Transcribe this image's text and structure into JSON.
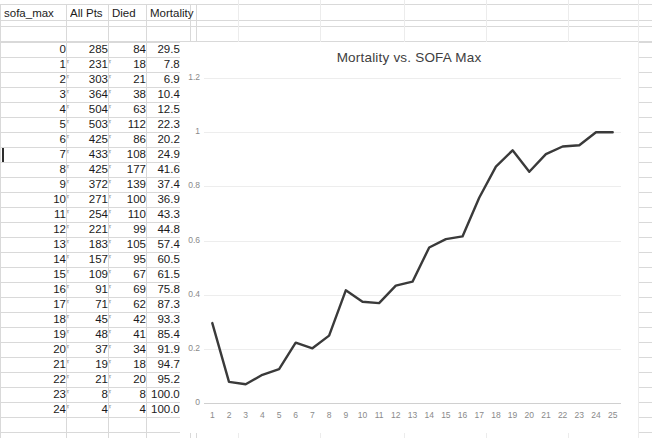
{
  "spreadsheet": {
    "columns": [
      "sofa_max",
      "All Pts",
      "Died",
      "Mortality"
    ],
    "rows": [
      {
        "sofa_max": "0",
        "all_pts": "285",
        "died": "84",
        "mortality": "29.5%"
      },
      {
        "sofa_max": "1",
        "all_pts": "231",
        "died": "18",
        "mortality": "7.8%"
      },
      {
        "sofa_max": "2",
        "all_pts": "303",
        "died": "21",
        "mortality": "6.9%"
      },
      {
        "sofa_max": "3",
        "all_pts": "364",
        "died": "38",
        "mortality": "10.4%"
      },
      {
        "sofa_max": "4",
        "all_pts": "504",
        "died": "63",
        "mortality": "12.5%"
      },
      {
        "sofa_max": "5",
        "all_pts": "503",
        "died": "112",
        "mortality": "22.3%"
      },
      {
        "sofa_max": "6",
        "all_pts": "425",
        "died": "86",
        "mortality": "20.2%"
      },
      {
        "sofa_max": "7",
        "all_pts": "433",
        "died": "108",
        "mortality": "24.9%"
      },
      {
        "sofa_max": "8",
        "all_pts": "425",
        "died": "177",
        "mortality": "41.6%"
      },
      {
        "sofa_max": "9",
        "all_pts": "372",
        "died": "139",
        "mortality": "37.4%"
      },
      {
        "sofa_max": "10",
        "all_pts": "271",
        "died": "100",
        "mortality": "36.9%"
      },
      {
        "sofa_max": "11",
        "all_pts": "254",
        "died": "110",
        "mortality": "43.3%"
      },
      {
        "sofa_max": "12",
        "all_pts": "221",
        "died": "99",
        "mortality": "44.8%"
      },
      {
        "sofa_max": "13",
        "all_pts": "183",
        "died": "105",
        "mortality": "57.4%"
      },
      {
        "sofa_max": "14",
        "all_pts": "157",
        "died": "95",
        "mortality": "60.5%"
      },
      {
        "sofa_max": "15",
        "all_pts": "109",
        "died": "67",
        "mortality": "61.5%"
      },
      {
        "sofa_max": "16",
        "all_pts": "91",
        "died": "69",
        "mortality": "75.8%"
      },
      {
        "sofa_max": "17",
        "all_pts": "71",
        "died": "62",
        "mortality": "87.3%"
      },
      {
        "sofa_max": "18",
        "all_pts": "45",
        "died": "42",
        "mortality": "93.3%"
      },
      {
        "sofa_max": "19",
        "all_pts": "48",
        "died": "41",
        "mortality": "85.4%"
      },
      {
        "sofa_max": "20",
        "all_pts": "37",
        "died": "34",
        "mortality": "91.9%"
      },
      {
        "sofa_max": "21",
        "all_pts": "19",
        "died": "18",
        "mortality": "94.7%"
      },
      {
        "sofa_max": "22",
        "all_pts": "21",
        "died": "20",
        "mortality": "95.2%"
      },
      {
        "sofa_max": "23",
        "all_pts": "8",
        "died": "8",
        "mortality": "100.0%"
      },
      {
        "sofa_max": "24",
        "all_pts": "4",
        "died": "4",
        "mortality": "100.0%"
      }
    ],
    "comment_tick_glyph": "r"
  },
  "chart_data": {
    "type": "line",
    "title": "Mortality vs. SOFA Max",
    "xlabel": "",
    "ylabel": "",
    "grid": true,
    "legend": "none",
    "line_color": "#3a3a3a",
    "categories": [
      "1",
      "2",
      "3",
      "4",
      "5",
      "6",
      "7",
      "8",
      "9",
      "10",
      "11",
      "12",
      "13",
      "14",
      "15",
      "16",
      "17",
      "18",
      "19",
      "20",
      "21",
      "22",
      "23",
      "24",
      "25"
    ],
    "values": [
      0.295,
      0.078,
      0.069,
      0.104,
      0.125,
      0.223,
      0.202,
      0.249,
      0.416,
      0.374,
      0.369,
      0.433,
      0.448,
      0.574,
      0.605,
      0.615,
      0.758,
      0.873,
      0.933,
      0.854,
      0.919,
      0.947,
      0.952,
      1.0,
      1.0
    ],
    "ylim": [
      0,
      1.2
    ],
    "yticks": [
      "0",
      "0.2",
      "0.4",
      "0.6",
      "0.8",
      "1",
      "1.2"
    ],
    "ytick_values": [
      0,
      0.2,
      0.4,
      0.6,
      0.8,
      1,
      1.2
    ]
  }
}
